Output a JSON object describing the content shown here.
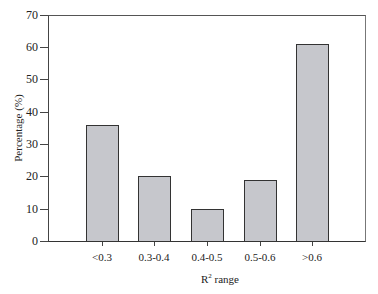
{
  "chart_data": {
    "type": "bar",
    "title": "",
    "xlabel": "R² range",
    "xlabel_base": "R",
    "xlabel_sup": "2",
    "xlabel_rest": " range",
    "ylabel": "Percentage (%)",
    "ylim": [
      0,
      70
    ],
    "yticks": [
      "0",
      "10",
      "20",
      "30",
      "40",
      "50",
      "60",
      "70"
    ],
    "categories": [
      "<0.3",
      "0.3-0.4",
      "0.4-0.5",
      "0.5-0.6",
      ">0.6"
    ],
    "values": [
      36,
      20,
      10,
      19,
      61
    ],
    "grid": false,
    "legend": null,
    "bar_color": "#c6c7cc"
  }
}
